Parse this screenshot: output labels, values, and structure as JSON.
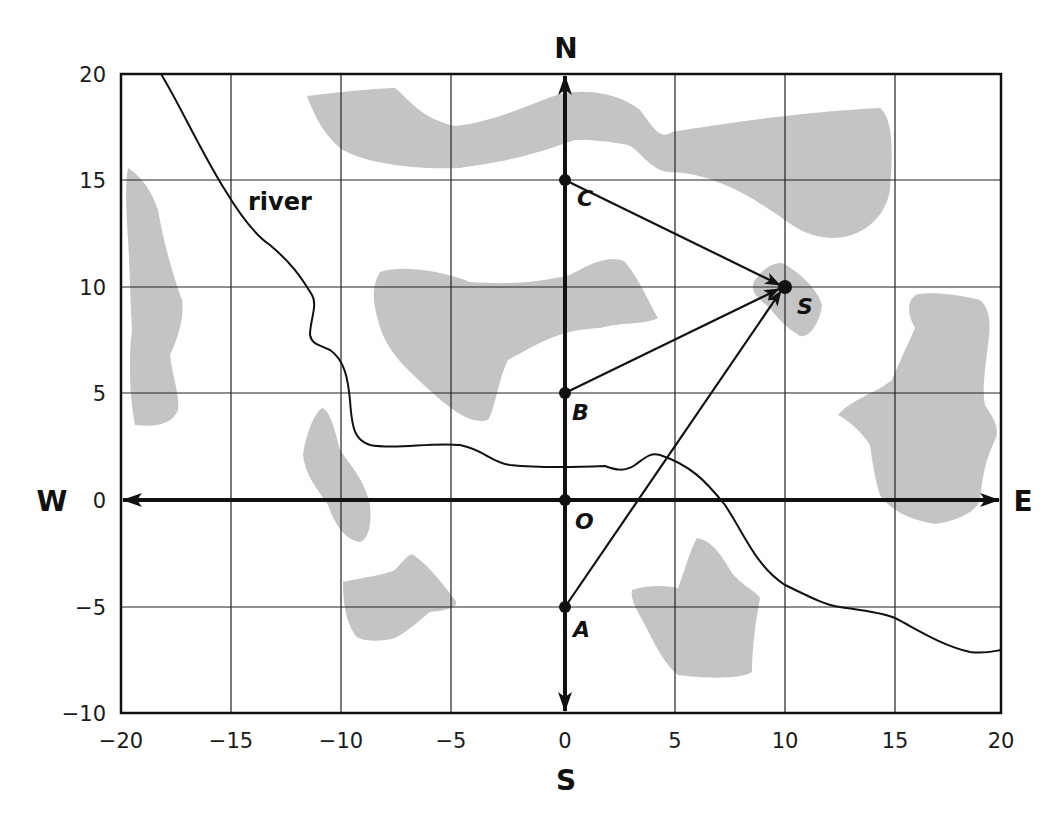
{
  "diagram": {
    "type": "coordinate-grid-map",
    "x_axis": {
      "range": [
        -20,
        20
      ],
      "ticks": [
        "−20",
        "−15",
        "−10",
        "−5",
        "0",
        "5",
        "10",
        "15",
        "20"
      ],
      "tick_values": [
        -20,
        -15,
        -10,
        -5,
        0,
        5,
        10,
        15,
        20
      ]
    },
    "y_axis": {
      "range": [
        -10,
        20
      ],
      "ticks": [
        "20",
        "15",
        "10",
        "5",
        "0",
        "−5",
        "−10"
      ],
      "tick_values": [
        20,
        15,
        10,
        5,
        0,
        -5,
        -10
      ]
    },
    "compass": {
      "north": "N",
      "south": "S",
      "east": "E",
      "west": "W"
    },
    "river_label": "river",
    "points": [
      {
        "name": "C",
        "x": 0,
        "y": 15
      },
      {
        "name": "B",
        "x": 0,
        "y": 5
      },
      {
        "name": "O",
        "x": 0,
        "y": 0
      },
      {
        "name": "A",
        "x": 0,
        "y": -5
      },
      {
        "name": "S",
        "x": 10,
        "y": 10
      }
    ],
    "vectors": [
      {
        "from": "C",
        "to": "S",
        "from_xy": [
          0,
          15
        ],
        "to_xy": [
          10,
          10
        ]
      },
      {
        "from": "B",
        "to": "S",
        "from_xy": [
          0,
          5
        ],
        "to_xy": [
          10,
          10
        ]
      },
      {
        "from": "A",
        "to": "S",
        "from_xy": [
          0,
          -5
        ],
        "to_xy": [
          10,
          10
        ]
      }
    ],
    "colors": {
      "land": "#c4c4c4",
      "lines": "#111111",
      "background": "#ffffff"
    }
  }
}
